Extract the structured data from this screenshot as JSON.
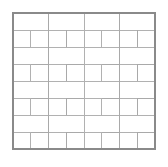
{
  "figure": {
    "title": "",
    "caption": "",
    "type": "pinwheel-tiling-diagram"
  },
  "canvas": {
    "width": 168,
    "height": 167,
    "background_color": "#ffffff"
  },
  "frame": {
    "x": 13,
    "y": 13,
    "width": 142,
    "height": 136,
    "stroke_color": "#8a8a8a",
    "stroke_width": 1.4,
    "fill_color": "#ffffff"
  },
  "tiling": {
    "pattern_name": "pinwheel",
    "stroke_color": "#a8a8a8",
    "stroke_width": 0.9,
    "tile_fill": "#ffffff",
    "unit_cell_cols": 4,
    "unit_cell_rows": 4,
    "unit_cell_width": 35.5,
    "unit_cell_height": 34.0,
    "tile_long_side_units": 2,
    "tile_short_side_units": 1,
    "tiles_per_unit_cell": 4,
    "total_tiles": 64
  },
  "chart_data": {
    "type": "diagram",
    "title": "",
    "xlabel": "",
    "ylabel": "",
    "note": "Rectangles are specified in unit-cell coordinates; each pinwheel block spans 2x2 half-units with four rectangles rotated 90 degrees successively around the block center.",
    "block_template": [
      {
        "x": 0.0,
        "y": 0.0,
        "w": 1.0,
        "h": 0.5
      },
      {
        "x": 1.0,
        "y": 0.0,
        "w": 0.5,
        "h": 1.0
      },
      {
        "x": 0.5,
        "y": 1.0,
        "w": 1.0,
        "h": 0.5
      },
      {
        "x": 0.0,
        "y": 0.5,
        "w": 0.5,
        "h": 1.0
      }
    ],
    "block_origins": [
      {
        "col": 0,
        "row": 0
      },
      {
        "col": 1,
        "row": 0
      },
      {
        "col": 2,
        "row": 0
      },
      {
        "col": 3,
        "row": 0
      },
      {
        "col": 0,
        "row": 1
      },
      {
        "col": 1,
        "row": 1
      },
      {
        "col": 2,
        "row": 1
      },
      {
        "col": 3,
        "row": 1
      },
      {
        "col": 0,
        "row": 2
      },
      {
        "col": 1,
        "row": 2
      },
      {
        "col": 2,
        "row": 2
      },
      {
        "col": 3,
        "row": 2
      },
      {
        "col": 0,
        "row": 3
      },
      {
        "col": 1,
        "row": 3
      },
      {
        "col": 2,
        "row": 3
      },
      {
        "col": 3,
        "row": 3
      }
    ]
  }
}
